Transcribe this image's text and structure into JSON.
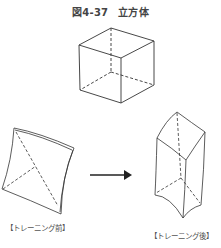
{
  "figure": {
    "number": "図4-37",
    "title": "立方体"
  },
  "panels": {
    "before": {
      "label": "【トレーニング前】"
    },
    "after": {
      "label": "【トレーニング後】"
    }
  },
  "arrow": {
    "direction": "right"
  },
  "colors": {
    "line": "#333333",
    "text": "#444444",
    "background": "#ffffff"
  }
}
